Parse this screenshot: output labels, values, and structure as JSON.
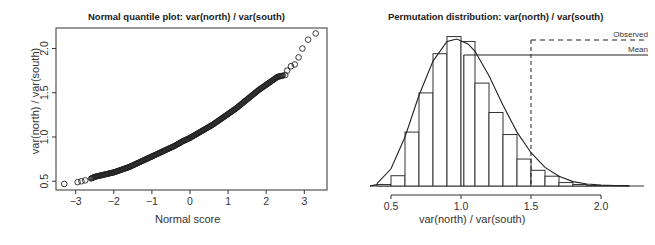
{
  "chart_data": [
    {
      "type": "scatter",
      "title": "Normal quantile plot: var(north) / var(south)",
      "xlabel": "Normal score",
      "ylabel": "var(north) / var(south)",
      "xlim": [
        -3.5,
        3.6
      ],
      "ylim": [
        0.42,
        2.25
      ],
      "xticks": [
        -3,
        -2,
        -1,
        0,
        1,
        2,
        3
      ],
      "xtick_labels": [
        "-3",
        "-2",
        "-1",
        "0",
        "1",
        "2",
        "3"
      ],
      "yticks": [
        0.5,
        1.0,
        1.5,
        2.0
      ],
      "ytick_labels": [
        "0.5",
        "1.0",
        "1.5",
        "2.0"
      ],
      "grid": false,
      "marker": "open-circle",
      "series": [
        {
          "name": "quantiles",
          "x": [
            -3.3,
            -2.95,
            -2.85,
            -2.75,
            -2.6,
            -2.5,
            -2.4,
            -2.3,
            -2.2,
            -2.1,
            -2.0,
            -1.8,
            -1.6,
            -1.4,
            -1.2,
            -1.0,
            -0.8,
            -0.6,
            -0.4,
            -0.2,
            0.0,
            0.2,
            0.4,
            0.6,
            0.8,
            1.0,
            1.2,
            1.4,
            1.6,
            1.8,
            2.0,
            2.1,
            2.2,
            2.3,
            2.4,
            2.5,
            2.55,
            2.65,
            2.75,
            2.85,
            2.95,
            3.1,
            3.3
          ],
          "y": [
            0.47,
            0.49,
            0.5,
            0.51,
            0.53,
            0.55,
            0.56,
            0.57,
            0.58,
            0.59,
            0.6,
            0.63,
            0.66,
            0.7,
            0.74,
            0.78,
            0.82,
            0.86,
            0.9,
            0.95,
            0.99,
            1.04,
            1.09,
            1.14,
            1.2,
            1.26,
            1.32,
            1.39,
            1.46,
            1.53,
            1.59,
            1.62,
            1.65,
            1.68,
            1.69,
            1.7,
            1.75,
            1.8,
            1.82,
            1.9,
            2.0,
            2.1,
            2.17
          ]
        }
      ]
    },
    {
      "type": "bar",
      "subtype": "histogram-with-density",
      "title": "Permutation distribution: var(north) / var(south)",
      "xlabel": "var(north) / var(south)",
      "ylabel": "",
      "xlim": [
        0.4,
        2.25
      ],
      "xticks": [
        0.5,
        1.0,
        1.5,
        2.0
      ],
      "xtick_labels": [
        "0.5",
        "1.0",
        "1.5",
        "2.0"
      ],
      "grid": false,
      "bin_edges": [
        0.4,
        0.5,
        0.6,
        0.7,
        0.8,
        0.9,
        1.0,
        1.1,
        1.2,
        1.3,
        1.4,
        1.5,
        1.6,
        1.7,
        1.8,
        1.9,
        2.0,
        2.1,
        2.2
      ],
      "categories": [
        "0.4-0.5",
        "0.5-0.6",
        "0.6-0.7",
        "0.7-0.8",
        "0.8-0.9",
        "0.9-1.0",
        "1.0-1.1",
        "1.1-1.2",
        "1.2-1.3",
        "1.3-1.4",
        "1.4-1.5",
        "1.5-1.6",
        "1.6-1.7",
        "1.7-1.8",
        "1.8-1.9",
        "1.9-2.0",
        "2.0-2.1",
        "2.1-2.2"
      ],
      "values": [
        0.03,
        0.21,
        1.1,
        1.9,
        2.7,
        3.05,
        2.95,
        2.1,
        1.5,
        1.05,
        0.55,
        0.32,
        0.2,
        0.07,
        0.03,
        0.01,
        0.01,
        0.01
      ],
      "density_curve": {
        "x": [
          0.4,
          0.5,
          0.6,
          0.7,
          0.8,
          0.9,
          0.97,
          1.05,
          1.1,
          1.2,
          1.3,
          1.4,
          1.5,
          1.6,
          1.7,
          1.8,
          1.9,
          2.0,
          2.1,
          2.2
        ],
        "y": [
          0.05,
          0.35,
          1.0,
          1.85,
          2.55,
          2.95,
          3.0,
          2.9,
          2.75,
          2.25,
          1.65,
          1.1,
          0.68,
          0.38,
          0.2,
          0.09,
          0.04,
          0.02,
          0.01,
          0.0
        ]
      },
      "ylim": [
        0,
        3.2
      ],
      "annotations": [
        {
          "label": "Observed",
          "style": "dashed",
          "x": 1.5
        },
        {
          "label": "Mean",
          "style": "solid",
          "x": 1.02
        }
      ],
      "legend_position": "top-right"
    }
  ]
}
